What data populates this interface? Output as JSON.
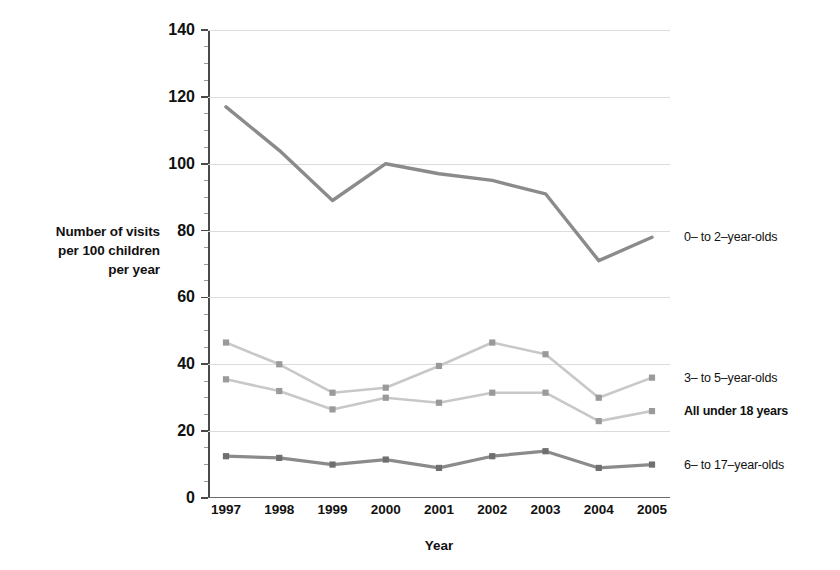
{
  "chart_data": {
    "type": "line",
    "title": "",
    "xlabel": "Year",
    "ylabel": "Number of visits per 100 children per year",
    "ylabel_lines": [
      "Number of visits",
      "per 100 children",
      "per year"
    ],
    "categories": [
      "1997",
      "1998",
      "1999",
      "2000",
      "2001",
      "2002",
      "2003",
      "2004",
      "2005"
    ],
    "ylim": [
      0,
      140
    ],
    "yticks": [
      0,
      20,
      40,
      60,
      80,
      100,
      120,
      140
    ],
    "ytick_labels": [
      "0",
      "20",
      "40",
      "60",
      "80",
      "100",
      "120",
      "140"
    ],
    "minor_tick_step": 5,
    "grid": true,
    "grid_axis": "y",
    "legend_position": "right-inline-end-labels",
    "series": [
      {
        "name": "0– to 2–year-olds",
        "bold_label": false,
        "color": "#8b8b8b",
        "marker": "none",
        "line_width": 3.4,
        "values": [
          117,
          104,
          89,
          100,
          97,
          95,
          91,
          71,
          78
        ]
      },
      {
        "name": "3– to 5–year-olds",
        "bold_label": false,
        "color": "#c8c8c8",
        "marker": "square",
        "marker_color": "#9a9a9a",
        "line_width": 2.6,
        "values": [
          46.5,
          40,
          31.5,
          33,
          39.5,
          46.5,
          43,
          30,
          36
        ]
      },
      {
        "name": "All under 18 years",
        "bold_label": true,
        "color": "#c8c8c8",
        "marker": "square",
        "marker_color": "#9a9a9a",
        "line_width": 2.6,
        "values": [
          35.5,
          32,
          26.5,
          30,
          28.5,
          31.5,
          31.5,
          23,
          26
        ]
      },
      {
        "name": "6– to 17–year-olds",
        "bold_label": false,
        "color": "#8b8b8b",
        "marker": "square",
        "marker_color": "#6f6f6f",
        "line_width": 3.2,
        "values": [
          12.5,
          12,
          10,
          11.5,
          9,
          12.5,
          14,
          9,
          10
        ]
      }
    ],
    "label_y_values": [
      78,
      36,
      26,
      10
    ],
    "colors": {
      "axis": "#4a4a4a",
      "grid": "#dcdcdc",
      "text": "#111111",
      "background": "#ffffff"
    }
  }
}
